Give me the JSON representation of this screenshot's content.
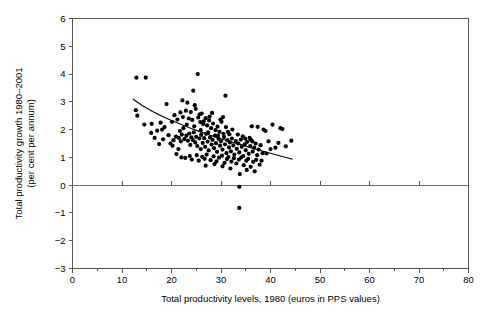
{
  "chart_data": {
    "type": "scatter",
    "title": "",
    "xlabel": "Total productivity levels, 1980 (euros in PPS values)",
    "ylabel": "Total productivity growth 1980–2001\n(per cent per annum)",
    "ylabel_line1": "Total productivity growth 1980–2001",
    "ylabel_line2": "(per cent per annum)",
    "xlim": [
      0,
      80
    ],
    "ylim": [
      -3,
      6
    ],
    "xticks": [
      0,
      10,
      20,
      30,
      40,
      50,
      60,
      70,
      80
    ],
    "xticklabels": [
      "0",
      "10",
      "20",
      "30",
      "40",
      "50",
      "60",
      "70",
      "80"
    ],
    "xminorticks": [
      5,
      15,
      25,
      35,
      45,
      55,
      65,
      75
    ],
    "yticks": [
      -3,
      -2,
      -1,
      0,
      1,
      2,
      3,
      4,
      5,
      6
    ],
    "yticklabels": [
      "−3",
      "−2",
      "−1",
      "0",
      "1",
      "2",
      "3",
      "4",
      "5",
      "6"
    ],
    "grid": false,
    "legend": null,
    "zero_reference_line": 0,
    "marker": "filled-circle",
    "marker_color": "#000000",
    "marker_size_px": 2.1,
    "trendline": {
      "style": "solid",
      "color": "#000000",
      "description": "fitted downward-sloping convex curve",
      "points": [
        [
          12.2,
          3.1
        ],
        [
          14.0,
          2.88
        ],
        [
          16.0,
          2.67
        ],
        [
          18.0,
          2.49
        ],
        [
          20.0,
          2.33
        ],
        [
          22.0,
          2.18
        ],
        [
          24.0,
          2.04
        ],
        [
          26.0,
          1.91
        ],
        [
          28.0,
          1.79
        ],
        [
          30.0,
          1.67
        ],
        [
          32.0,
          1.56
        ],
        [
          34.0,
          1.46
        ],
        [
          36.0,
          1.35
        ],
        [
          38.0,
          1.25
        ],
        [
          40.0,
          1.15
        ],
        [
          42.0,
          1.05
        ],
        [
          44.5,
          0.93
        ]
      ]
    },
    "points": [
      [
        12.9,
        3.87
      ],
      [
        14.8,
        3.87
      ],
      [
        25.3,
        4.0
      ],
      [
        12.8,
        2.7
      ],
      [
        13.1,
        2.5
      ],
      [
        30.9,
        3.22
      ],
      [
        24.4,
        3.4
      ],
      [
        22.2,
        3.05
      ],
      [
        23.2,
        2.97
      ],
      [
        19.0,
        2.92
      ],
      [
        14.5,
        2.18
      ],
      [
        16.0,
        2.21
      ],
      [
        17.8,
        2.25
      ],
      [
        18.1,
        2.0
      ],
      [
        20.6,
        2.52
      ],
      [
        21.2,
        2.36
      ],
      [
        21.8,
        2.62
      ],
      [
        22.3,
        2.45
      ],
      [
        22.9,
        2.68
      ],
      [
        23.5,
        2.4
      ],
      [
        23.9,
        2.63
      ],
      [
        24.2,
        2.35
      ],
      [
        24.6,
        2.12
      ],
      [
        24.9,
        2.75
      ],
      [
        25.4,
        2.44
      ],
      [
        25.8,
        2.27
      ],
      [
        26.1,
        2.58
      ],
      [
        26.4,
        2.2
      ],
      [
        26.9,
        2.41
      ],
      [
        27.2,
        2.15
      ],
      [
        27.6,
        2.33
      ],
      [
        28.0,
        2.05
      ],
      [
        28.4,
        2.22
      ],
      [
        28.9,
        1.98
      ],
      [
        29.3,
        2.11
      ],
      [
        29.7,
        1.92
      ],
      [
        30.1,
        2.28
      ],
      [
        30.5,
        1.85
      ],
      [
        31.0,
        2.09
      ],
      [
        15.9,
        1.88
      ],
      [
        17.1,
        1.96
      ],
      [
        18.6,
        2.09
      ],
      [
        19.4,
        1.8
      ],
      [
        20.1,
        2.28
      ],
      [
        20.4,
        1.62
      ],
      [
        20.9,
        1.75
      ],
      [
        21.0,
        1.12
      ],
      [
        21.5,
        1.7
      ],
      [
        21.9,
        1.58
      ],
      [
        22.1,
        1.82
      ],
      [
        22.6,
        1.66
      ],
      [
        23.0,
        1.78
      ],
      [
        23.3,
        1.6
      ],
      [
        23.6,
        1.86
      ],
      [
        23.8,
        1.45
      ],
      [
        24.0,
        1.72
      ],
      [
        24.3,
        1.63
      ],
      [
        24.5,
        1.9
      ],
      [
        24.8,
        1.54
      ],
      [
        25.0,
        1.74
      ],
      [
        25.2,
        1.41
      ],
      [
        25.6,
        1.68
      ],
      [
        25.9,
        1.3
      ],
      [
        26.0,
        1.81
      ],
      [
        26.3,
        1.52
      ],
      [
        26.6,
        1.69
      ],
      [
        26.8,
        1.38
      ],
      [
        27.0,
        1.85
      ],
      [
        27.3,
        1.57
      ],
      [
        27.5,
        1.25
      ],
      [
        27.8,
        1.72
      ],
      [
        28.1,
        1.46
      ],
      [
        28.3,
        1.63
      ],
      [
        28.6,
        1.33
      ],
      [
        28.8,
        1.78
      ],
      [
        29.0,
        1.51
      ],
      [
        29.2,
        1.2
      ],
      [
        29.5,
        1.67
      ],
      [
        29.8,
        1.42
      ],
      [
        30.0,
        1.58
      ],
      [
        30.3,
        1.28
      ],
      [
        30.6,
        1.73
      ],
      [
        30.8,
        1.47
      ],
      [
        31.1,
        1.15
      ],
      [
        31.3,
        1.62
      ],
      [
        31.6,
        1.36
      ],
      [
        31.8,
        1.54
      ],
      [
        32.0,
        1.22
      ],
      [
        32.2,
        1.68
      ],
      [
        32.5,
        1.43
      ],
      [
        32.7,
        1.1
      ],
      [
        33.0,
        1.59
      ],
      [
        33.2,
        1.31
      ],
      [
        33.5,
        1.5
      ],
      [
        33.7,
        1.18
      ],
      [
        34.0,
        1.64
      ],
      [
        34.2,
        1.38
      ],
      [
        34.5,
        1.05
      ],
      [
        34.8,
        1.47
      ],
      [
        35.0,
        1.26
      ],
      [
        35.3,
        1.56
      ],
      [
        35.6,
        1.13
      ],
      [
        35.9,
        1.41
      ],
      [
        36.1,
        1.62
      ],
      [
        36.4,
        1.21
      ],
      [
        36.7,
        1.35
      ],
      [
        37.0,
        1.5
      ],
      [
        37.3,
        1.08
      ],
      [
        37.6,
        1.28
      ],
      [
        38.0,
        1.44
      ],
      [
        38.4,
        1.15
      ],
      [
        22.0,
        1.0
      ],
      [
        22.8,
        0.98
      ],
      [
        23.7,
        1.05
      ],
      [
        24.1,
        0.92
      ],
      [
        25.1,
        1.08
      ],
      [
        25.5,
        0.88
      ],
      [
        26.2,
        1.02
      ],
      [
        26.7,
        0.95
      ],
      [
        27.1,
        1.1
      ],
      [
        27.9,
        0.9
      ],
      [
        28.5,
        1.04
      ],
      [
        29.1,
        0.86
      ],
      [
        29.6,
        0.99
      ],
      [
        30.2,
        1.06
      ],
      [
        30.7,
        0.8
      ],
      [
        31.2,
        0.94
      ],
      [
        31.5,
        1.01
      ],
      [
        32.1,
        0.85
      ],
      [
        32.6,
        0.97
      ],
      [
        33.1,
        0.78
      ],
      [
        33.6,
        0.92
      ],
      [
        34.1,
        1.0
      ],
      [
        34.6,
        0.72
      ],
      [
        35.1,
        0.88
      ],
      [
        35.5,
        0.95
      ],
      [
        36.0,
        0.66
      ],
      [
        36.5,
        0.84
      ],
      [
        37.1,
        0.91
      ],
      [
        37.8,
        0.74
      ],
      [
        38.2,
        0.88
      ],
      [
        30.3,
        0.68
      ],
      [
        33.8,
        0.4
      ],
      [
        35.2,
        0.55
      ],
      [
        36.8,
        0.5
      ],
      [
        31.9,
        0.6
      ],
      [
        39.0,
        1.95
      ],
      [
        39.6,
        1.58
      ],
      [
        40.4,
        2.18
      ],
      [
        41.0,
        1.35
      ],
      [
        41.6,
        1.52
      ],
      [
        42.0,
        2.05
      ],
      [
        42.4,
        2.02
      ],
      [
        43.1,
        1.4
      ],
      [
        44.2,
        1.6
      ],
      [
        38.6,
        2.0
      ],
      [
        39.2,
        1.14
      ],
      [
        40.0,
        1.3
      ],
      [
        37.4,
        2.1
      ],
      [
        36.2,
        2.12
      ],
      [
        33.7,
        -0.06
      ],
      [
        33.7,
        -0.82
      ],
      [
        19.8,
        1.5
      ],
      [
        18.3,
        1.65
      ],
      [
        17.5,
        1.48
      ],
      [
        16.6,
        1.7
      ],
      [
        20.2,
        1.42
      ],
      [
        21.4,
        1.3
      ],
      [
        24.7,
        2.88
      ],
      [
        25.7,
        2.55
      ],
      [
        26.5,
        2.3
      ],
      [
        27.7,
        2.47
      ],
      [
        28.2,
        2.6
      ],
      [
        29.9,
        2.36
      ],
      [
        31.4,
        1.92
      ],
      [
        32.3,
        2.0
      ],
      [
        33.4,
        1.82
      ],
      [
        34.4,
        1.76
      ],
      [
        35.8,
        1.7
      ],
      [
        30.4,
        2.45
      ],
      [
        23.1,
        2.18
      ],
      [
        22.4,
        2.05
      ],
      [
        21.7,
        1.95
      ],
      [
        25.9,
        1.98
      ],
      [
        27.4,
        1.9
      ],
      [
        29.4,
        1.78
      ],
      [
        31.7,
        1.83
      ],
      [
        34.9,
        1.68
      ],
      [
        36.3,
        1.58
      ],
      [
        28.7,
        0.76
      ],
      [
        26.9,
        0.7
      ]
    ],
    "n_points": 198
  }
}
